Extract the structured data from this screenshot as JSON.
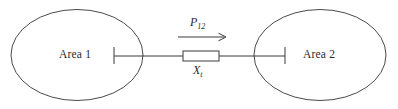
{
  "diagram": {
    "type": "single-line-diagram",
    "background_color": "#ffffff",
    "line_color": "#3a3a3a",
    "areas": [
      {
        "id": "area-1",
        "label": "Area 1",
        "shape": "ellipse",
        "cx": 77,
        "cy": 55,
        "rx": 66,
        "ry": 45.5
      },
      {
        "id": "area-2",
        "label": "Area 2",
        "shape": "ellipse",
        "cx": 320,
        "cy": 55,
        "rx": 66,
        "ry": 45.5
      }
    ],
    "buses": [
      {
        "id": "bus-area-1",
        "x": 114,
        "y_top": 47,
        "y_bottom": 64
      },
      {
        "id": "bus-area-2",
        "x": 285,
        "y_top": 47,
        "y_bottom": 64
      }
    ],
    "tie_line": {
      "id": "tie-line",
      "y": 56,
      "x_start": 114,
      "x_end": 285,
      "reactance": {
        "label": "X",
        "label_subscript": "t",
        "box_x": 183,
        "box_y": 51,
        "box_width": 36,
        "box_height": 10
      }
    },
    "power_flow": {
      "label": "P",
      "label_subscript": "12",
      "direction": "left-to-right",
      "arrow_x_start": 178,
      "arrow_x_end": 226,
      "arrow_y": 37
    }
  }
}
